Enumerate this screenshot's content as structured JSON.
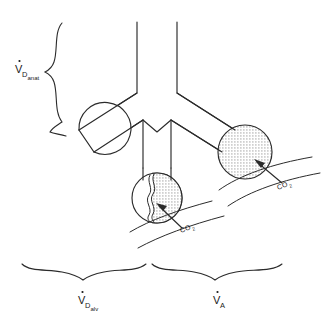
{
  "figure": {
    "labels": {
      "anatomic_dead_space": {
        "symbol": "V",
        "dot": "˙",
        "sub_main": "D",
        "sub_small": "anat",
        "full": "V̇D anat"
      },
      "alveolar_dead_space": {
        "symbol": "V",
        "dot": "˙",
        "sub_main": "D",
        "sub_small": "alv",
        "full": "V̇D alv"
      },
      "alveolar_ventilation": {
        "symbol": "V",
        "dot": "˙",
        "sub_main": "A",
        "sub_small": "",
        "full": "V̇A"
      },
      "gas_left": {
        "text": "CO",
        "sub": "2"
      },
      "gas_right": {
        "text": "CO",
        "sub": "2"
      }
    },
    "elements": {
      "trachea": "central-airway-tube",
      "bronchus_left": "left-bronchus",
      "bronchus_right": "right-bronchus",
      "alveolus_left": "unperfused-alveolus-unshaded",
      "alveolus_middle": "partially-perfused-alveolus-half-shaded",
      "alveolus_right": "perfused-alveolus-fully-shaded",
      "capillary_left": "pulmonary-capillary-left",
      "capillary_right": "pulmonary-capillary-right",
      "arrow_left": "co2-diffusion-arrow-left",
      "arrow_right": "co2-diffusion-arrow-right",
      "brace_vertical": "anatomic-dead-space-brace",
      "brace_bottom_left": "alveolar-dead-space-brace",
      "brace_bottom_right": "alveolar-ventilation-brace"
    },
    "colors": {
      "stroke": "#2b2b2b",
      "background": "#ffffff",
      "shading": "#b9b9b9",
      "text": "#1a1a1a"
    }
  }
}
